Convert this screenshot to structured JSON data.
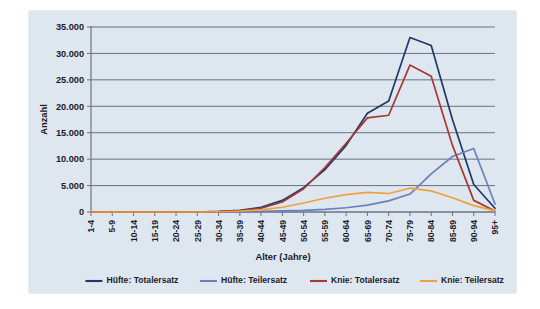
{
  "chart_data": {
    "type": "line",
    "title": "",
    "xlabel": "Alter (Jahre)",
    "ylabel": "Anzahl",
    "categories": [
      "1-4",
      "5-9",
      "10-14",
      "15-19",
      "20-24",
      "25-29",
      "30-34",
      "35-39",
      "40-44",
      "45-49",
      "50-54",
      "55-59",
      "60-64",
      "65-69",
      "70-74",
      "75-79",
      "80-84",
      "85-89",
      "90-94",
      "95+"
    ],
    "ylim": [
      0,
      35000
    ],
    "ytick_labels": [
      "0",
      "5.000",
      "10.000",
      "15.000",
      "20.000",
      "25.000",
      "30.000",
      "35.000"
    ],
    "ytick_values": [
      0,
      5000,
      10000,
      15000,
      20000,
      25000,
      30000,
      35000
    ],
    "grid": true,
    "legend_position": "bottom",
    "series": [
      {
        "name": "Hüfte: Totalersatz",
        "color": "#1f3864",
        "values": [
          0,
          0,
          0,
          0,
          0,
          0,
          100,
          300,
          900,
          2200,
          4600,
          8000,
          12600,
          18700,
          21000,
          33000,
          31500,
          17500,
          5200,
          700
        ]
      },
      {
        "name": "Hüfte: Teilersatz",
        "color": "#6b7fbf",
        "values": [
          0,
          0,
          0,
          0,
          0,
          0,
          0,
          0,
          100,
          200,
          300,
          500,
          800,
          1300,
          2100,
          3400,
          7200,
          10500,
          12000,
          1500
        ]
      },
      {
        "name": "Knie: Totalersatz",
        "color": "#a33a32",
        "values": [
          0,
          0,
          0,
          0,
          0,
          0,
          50,
          200,
          700,
          1900,
          4400,
          8400,
          13000,
          17800,
          18300,
          27800,
          25700,
          12600,
          2200,
          200
        ]
      },
      {
        "name": "Knie: Teilersatz",
        "color": "#f0a03c",
        "values": [
          0,
          0,
          0,
          0,
          0,
          0,
          50,
          150,
          400,
          900,
          1700,
          2600,
          3300,
          3700,
          3500,
          4500,
          4000,
          2700,
          1200,
          200
        ]
      }
    ]
  },
  "legend": {
    "items": [
      {
        "label": "Hüfte: Totalersatz",
        "color": "#1f3864"
      },
      {
        "label": "Hüfte: Teilersatz",
        "color": "#6b7fbf"
      },
      {
        "label": "Knie: Totalersatz",
        "color": "#a33a32"
      },
      {
        "label": "Knie: Teilersatz",
        "color": "#f0a03c"
      }
    ]
  },
  "colors": {
    "plot_background": "#dee6f0",
    "gridline": "#5a6474",
    "axis": "#6b7484",
    "text": "#1c1c28"
  }
}
